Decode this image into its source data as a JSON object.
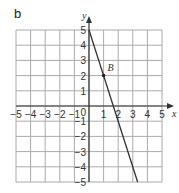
{
  "panel_label": "b",
  "chart_data": {
    "type": "line",
    "title": "",
    "xlabel": "x",
    "ylabel": "y",
    "xlim": [
      -5,
      5
    ],
    "ylim": [
      -5,
      5
    ],
    "grid": true,
    "x_ticks": [
      "-5",
      "-4",
      "-3",
      "-2",
      "-1",
      "1",
      "2",
      "3",
      "4",
      "5"
    ],
    "y_ticks": [
      "5",
      "4",
      "3",
      "2",
      "1",
      "-1",
      "-2",
      "-3",
      "-4",
      "-5"
    ],
    "origin_label": "0",
    "series": [
      {
        "name": "line",
        "equation": "y = -3x + 5",
        "x": [
          0,
          3.33
        ],
        "y": [
          5,
          -5
        ],
        "color": "#333333"
      }
    ],
    "points": [
      {
        "label": "B",
        "x": 1,
        "y": 2
      }
    ]
  }
}
